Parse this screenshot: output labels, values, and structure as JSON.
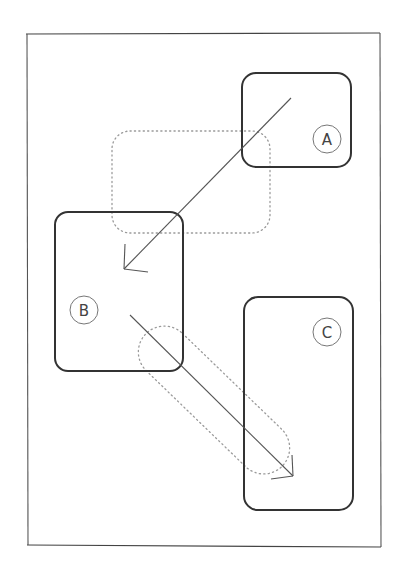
{
  "diagram": {
    "type": "hand-drawn layout transition sketch",
    "frame": {
      "x1": 26,
      "y1": 34,
      "x2": 380,
      "y2": 546
    },
    "boxes": [
      {
        "id": "A",
        "label": "A",
        "x": 242,
        "y": 73,
        "w": 109,
        "h": 94,
        "label_pos": [
          329,
          140
        ]
      },
      {
        "id": "B",
        "label": "B",
        "x": 55,
        "y": 212,
        "w": 128,
        "h": 159,
        "label_pos": [
          84,
          310
        ]
      },
      {
        "id": "C",
        "label": "C",
        "x": 244,
        "y": 297,
        "w": 109,
        "h": 213,
        "label_pos": [
          327,
          332
        ]
      }
    ],
    "ghost_shapes": [
      {
        "id": "ghost-rect",
        "style": "dotted",
        "x": 112,
        "y": 131,
        "w": 158,
        "h": 102
      },
      {
        "id": "ghost-capsule",
        "style": "dotted",
        "cx": 214,
        "cy": 400,
        "length": 190,
        "thickness": 52,
        "angle": 44
      }
    ],
    "arrows": [
      {
        "id": "arrow-a-to-b",
        "from": "A",
        "to": "B",
        "x1": 291,
        "y1": 98,
        "x2": 124,
        "y2": 269
      },
      {
        "id": "arrow-b-to-c",
        "from": "B",
        "to": "C",
        "x1": 130,
        "y1": 315,
        "x2": 293,
        "y2": 476
      }
    ],
    "colors": {
      "stroke": "#333333",
      "thin": "#555555",
      "dotted": "#999999",
      "label_circle": "#777777"
    }
  }
}
